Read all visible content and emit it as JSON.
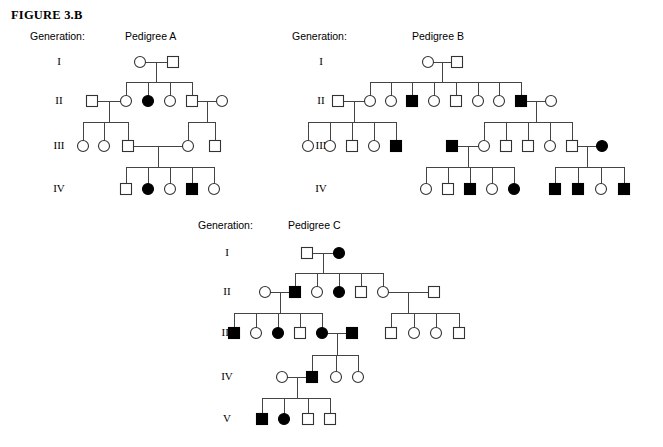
{
  "figure": {
    "title": "FIGURE 3.B"
  },
  "legend": {
    "generation_label": "Generation:",
    "roman_numerals": [
      "I",
      "II",
      "III",
      "IV",
      "V"
    ],
    "symbols": {
      "square": "male",
      "circle": "female",
      "filled": "affected",
      "open": "unaffected"
    },
    "colors": {
      "affected_fill": "#000000",
      "unaffected_fill": "#ffffff",
      "stroke": "#333333",
      "line": "#444444",
      "background": "#ffffff"
    }
  },
  "pedigrees": [
    {
      "id": "A",
      "title": "Pedigree A",
      "generation_label": "Generation:",
      "generations": [
        {
          "roman": "I",
          "individuals": [
            {
              "sex": "female",
              "affected": false
            },
            {
              "sex": "male",
              "affected": false
            }
          ]
        },
        {
          "roman": "II",
          "individuals": [
            {
              "sex": "male",
              "affected": false
            },
            {
              "sex": "female",
              "affected": false
            },
            {
              "sex": "female",
              "affected": true
            },
            {
              "sex": "female",
              "affected": false
            },
            {
              "sex": "male",
              "affected": false
            },
            {
              "sex": "female",
              "affected": false
            }
          ]
        },
        {
          "roman": "III",
          "individuals": [
            {
              "sex": "female",
              "affected": false
            },
            {
              "sex": "female",
              "affected": false
            },
            {
              "sex": "male",
              "affected": false
            },
            {
              "sex": "female",
              "affected": false
            },
            {
              "sex": "male",
              "affected": false
            }
          ]
        },
        {
          "roman": "IV",
          "individuals": [
            {
              "sex": "male",
              "affected": false
            },
            {
              "sex": "female",
              "affected": true
            },
            {
              "sex": "female",
              "affected": false
            },
            {
              "sex": "male",
              "affected": true
            },
            {
              "sex": "female",
              "affected": false
            }
          ]
        }
      ]
    },
    {
      "id": "B",
      "title": "Pedigree B",
      "generation_label": "Generation:",
      "generations": [
        {
          "roman": "I",
          "individuals": [
            {
              "sex": "female",
              "affected": false
            },
            {
              "sex": "male",
              "affected": false
            }
          ]
        },
        {
          "roman": "II",
          "individuals": [
            {
              "sex": "male",
              "affected": false
            },
            {
              "sex": "female",
              "affected": false
            },
            {
              "sex": "female",
              "affected": false
            },
            {
              "sex": "male",
              "affected": true
            },
            {
              "sex": "female",
              "affected": false
            },
            {
              "sex": "male",
              "affected": false
            },
            {
              "sex": "female",
              "affected": false
            },
            {
              "sex": "female",
              "affected": false
            },
            {
              "sex": "male",
              "affected": true
            },
            {
              "sex": "female",
              "affected": false
            }
          ]
        },
        {
          "roman": "III",
          "individuals": [
            {
              "sex": "female",
              "affected": false
            },
            {
              "sex": "female",
              "affected": false
            },
            {
              "sex": "male",
              "affected": false
            },
            {
              "sex": "female",
              "affected": false
            },
            {
              "sex": "male",
              "affected": true
            },
            {
              "sex": "male",
              "affected": true
            },
            {
              "sex": "female",
              "affected": false
            },
            {
              "sex": "male",
              "affected": false
            },
            {
              "sex": "male",
              "affected": false
            },
            {
              "sex": "female",
              "affected": false
            },
            {
              "sex": "male",
              "affected": false
            },
            {
              "sex": "female",
              "affected": true
            }
          ]
        },
        {
          "roman": "IV",
          "individuals": [
            {
              "sex": "female",
              "affected": false
            },
            {
              "sex": "male",
              "affected": false
            },
            {
              "sex": "male",
              "affected": true
            },
            {
              "sex": "female",
              "affected": false
            },
            {
              "sex": "female",
              "affected": true
            },
            {
              "sex": "male",
              "affected": true
            },
            {
              "sex": "male",
              "affected": true
            },
            {
              "sex": "female",
              "affected": false
            },
            {
              "sex": "male",
              "affected": true
            }
          ]
        }
      ]
    },
    {
      "id": "C",
      "title": "Pedigree C",
      "generation_label": "Generation:",
      "generations": [
        {
          "roman": "I",
          "individuals": [
            {
              "sex": "male",
              "affected": false
            },
            {
              "sex": "female",
              "affected": true
            }
          ]
        },
        {
          "roman": "II",
          "individuals": [
            {
              "sex": "female",
              "affected": false
            },
            {
              "sex": "male",
              "affected": true
            },
            {
              "sex": "female",
              "affected": false
            },
            {
              "sex": "female",
              "affected": true
            },
            {
              "sex": "male",
              "affected": false
            },
            {
              "sex": "female",
              "affected": false
            },
            {
              "sex": "male",
              "affected": false
            }
          ]
        },
        {
          "roman": "III",
          "individuals": [
            {
              "sex": "male",
              "affected": true
            },
            {
              "sex": "female",
              "affected": false
            },
            {
              "sex": "female",
              "affected": true
            },
            {
              "sex": "male",
              "affected": false
            },
            {
              "sex": "female",
              "affected": true
            },
            {
              "sex": "male",
              "affected": true
            },
            {
              "sex": "male",
              "affected": false
            },
            {
              "sex": "female",
              "affected": false
            },
            {
              "sex": "female",
              "affected": false
            },
            {
              "sex": "male",
              "affected": false
            }
          ]
        },
        {
          "roman": "IV",
          "individuals": [
            {
              "sex": "female",
              "affected": false
            },
            {
              "sex": "male",
              "affected": true
            },
            {
              "sex": "female",
              "affected": false
            },
            {
              "sex": "female",
              "affected": false
            }
          ]
        },
        {
          "roman": "V",
          "individuals": [
            {
              "sex": "male",
              "affected": true
            },
            {
              "sex": "female",
              "affected": true
            },
            {
              "sex": "male",
              "affected": false
            },
            {
              "sex": "male",
              "affected": false
            }
          ]
        }
      ]
    }
  ],
  "layout": {
    "A": {
      "label_x": 30,
      "label_y": 36,
      "title_x": 125,
      "title_y": 36,
      "roman_x": 36,
      "roman_y": [
        55,
        94,
        139,
        182
      ],
      "rows": [
        62,
        101,
        146,
        189
      ],
      "nodes": {
        "I": [
          {
            "x": 140,
            "sex": "female",
            "aff": false
          },
          {
            "x": 173,
            "sex": "male",
            "aff": false
          }
        ],
        "II": [
          {
            "x": 92,
            "sex": "male",
            "aff": false
          },
          {
            "x": 126,
            "sex": "female",
            "aff": false
          },
          {
            "x": 148,
            "sex": "female",
            "aff": true
          },
          {
            "x": 170,
            "sex": "female",
            "aff": false
          },
          {
            "x": 192,
            "sex": "male",
            "aff": false
          },
          {
            "x": 222,
            "sex": "female",
            "aff": false
          }
        ],
        "III": [
          {
            "x": 83,
            "sex": "female",
            "aff": false
          },
          {
            "x": 104,
            "sex": "female",
            "aff": false
          },
          {
            "x": 128,
            "sex": "male",
            "aff": false
          },
          {
            "x": 188,
            "sex": "female",
            "aff": false
          },
          {
            "x": 215,
            "sex": "male",
            "aff": false
          }
        ],
        "IV": [
          {
            "x": 126,
            "sex": "male",
            "aff": false
          },
          {
            "x": 148,
            "sex": "female",
            "aff": true
          },
          {
            "x": 170,
            "sex": "female",
            "aff": false
          },
          {
            "x": 192,
            "sex": "male",
            "aff": true
          },
          {
            "x": 214,
            "sex": "female",
            "aff": false
          }
        ]
      }
    },
    "B": {
      "label_x": 292,
      "label_y": 36,
      "title_x": 443,
      "title_y": 36,
      "roman_x": 298,
      "roman_y": [
        55,
        94,
        139,
        182
      ],
      "rows": [
        62,
        101,
        146,
        189
      ],
      "nodes": {
        "I": [
          {
            "x": 428,
            "sex": "female",
            "aff": false
          },
          {
            "x": 457,
            "sex": "male",
            "aff": false
          }
        ],
        "II": [
          {
            "x": 338,
            "sex": "male",
            "aff": false
          },
          {
            "x": 370,
            "sex": "female",
            "aff": false
          },
          {
            "x": 391,
            "sex": "female",
            "aff": false
          },
          {
            "x": 412,
            "sex": "male",
            "aff": true
          },
          {
            "x": 434,
            "sex": "female",
            "aff": false
          },
          {
            "x": 456,
            "sex": "male",
            "aff": false
          },
          {
            "x": 478,
            "sex": "female",
            "aff": false
          },
          {
            "x": 499,
            "sex": "female",
            "aff": false
          },
          {
            "x": 521,
            "sex": "male",
            "aff": true
          },
          {
            "x": 551,
            "sex": "female",
            "aff": false
          }
        ],
        "III": [
          {
            "x": 308,
            "sex": "female",
            "aff": false
          },
          {
            "x": 330,
            "sex": "female",
            "aff": false
          },
          {
            "x": 352,
            "sex": "male",
            "aff": false
          },
          {
            "x": 374,
            "sex": "female",
            "aff": false
          },
          {
            "x": 396,
            "sex": "male",
            "aff": true
          },
          {
            "x": 452,
            "sex": "male",
            "aff": true
          },
          {
            "x": 484,
            "sex": "female",
            "aff": false
          },
          {
            "x": 506,
            "sex": "male",
            "aff": false
          },
          {
            "x": 528,
            "sex": "male",
            "aff": false
          },
          {
            "x": 550,
            "sex": "female",
            "aff": false
          },
          {
            "x": 572,
            "sex": "male",
            "aff": false
          },
          {
            "x": 602,
            "sex": "female",
            "aff": true
          }
        ],
        "IV": [
          {
            "x": 426,
            "sex": "female",
            "aff": false
          },
          {
            "x": 448,
            "sex": "male",
            "aff": false
          },
          {
            "x": 470,
            "sex": "male",
            "aff": true
          },
          {
            "x": 492,
            "sex": "female",
            "aff": false
          },
          {
            "x": 514,
            "sex": "female",
            "aff": true
          },
          {
            "x": 555,
            "sex": "male",
            "aff": true
          },
          {
            "x": 578,
            "sex": "male",
            "aff": true
          },
          {
            "x": 601,
            "sex": "female",
            "aff": false
          },
          {
            "x": 624,
            "sex": "male",
            "aff": true
          }
        ]
      }
    },
    "C": {
      "label_x": 198,
      "label_y": 225,
      "title_x": 318,
      "title_y": 225,
      "roman_x": 204,
      "roman_y": [
        246,
        285,
        326,
        370,
        412
      ],
      "rows": [
        253,
        292,
        333,
        377,
        419
      ],
      "nodes": {
        "I": [
          {
            "x": 307,
            "sex": "male",
            "aff": false
          },
          {
            "x": 339,
            "sex": "female",
            "aff": true
          }
        ],
        "II": [
          {
            "x": 265,
            "sex": "female",
            "aff": false
          },
          {
            "x": 295,
            "sex": "male",
            "aff": true
          },
          {
            "x": 317,
            "sex": "female",
            "aff": false
          },
          {
            "x": 339,
            "sex": "female",
            "aff": true
          },
          {
            "x": 361,
            "sex": "male",
            "aff": false
          },
          {
            "x": 383,
            "sex": "female",
            "aff": false
          },
          {
            "x": 434,
            "sex": "male",
            "aff": false
          }
        ],
        "III": [
          {
            "x": 234,
            "sex": "male",
            "aff": true
          },
          {
            "x": 256,
            "sex": "female",
            "aff": false
          },
          {
            "x": 278,
            "sex": "female",
            "aff": true
          },
          {
            "x": 300,
            "sex": "male",
            "aff": false
          },
          {
            "x": 322,
            "sex": "female",
            "aff": true
          },
          {
            "x": 352,
            "sex": "male",
            "aff": true
          },
          {
            "x": 391,
            "sex": "male",
            "aff": false
          },
          {
            "x": 414,
            "sex": "female",
            "aff": false
          },
          {
            "x": 436,
            "sex": "female",
            "aff": false
          },
          {
            "x": 459,
            "sex": "male",
            "aff": false
          }
        ],
        "IV": [
          {
            "x": 282,
            "sex": "female",
            "aff": false
          },
          {
            "x": 312,
            "sex": "male",
            "aff": true
          },
          {
            "x": 336,
            "sex": "female",
            "aff": false
          },
          {
            "x": 358,
            "sex": "female",
            "aff": false
          }
        ],
        "V": [
          {
            "x": 262,
            "sex": "male",
            "aff": true
          },
          {
            "x": 284,
            "sex": "female",
            "aff": true
          },
          {
            "x": 308,
            "sex": "male",
            "aff": false
          },
          {
            "x": 330,
            "sex": "male",
            "aff": false
          }
        ]
      }
    }
  }
}
